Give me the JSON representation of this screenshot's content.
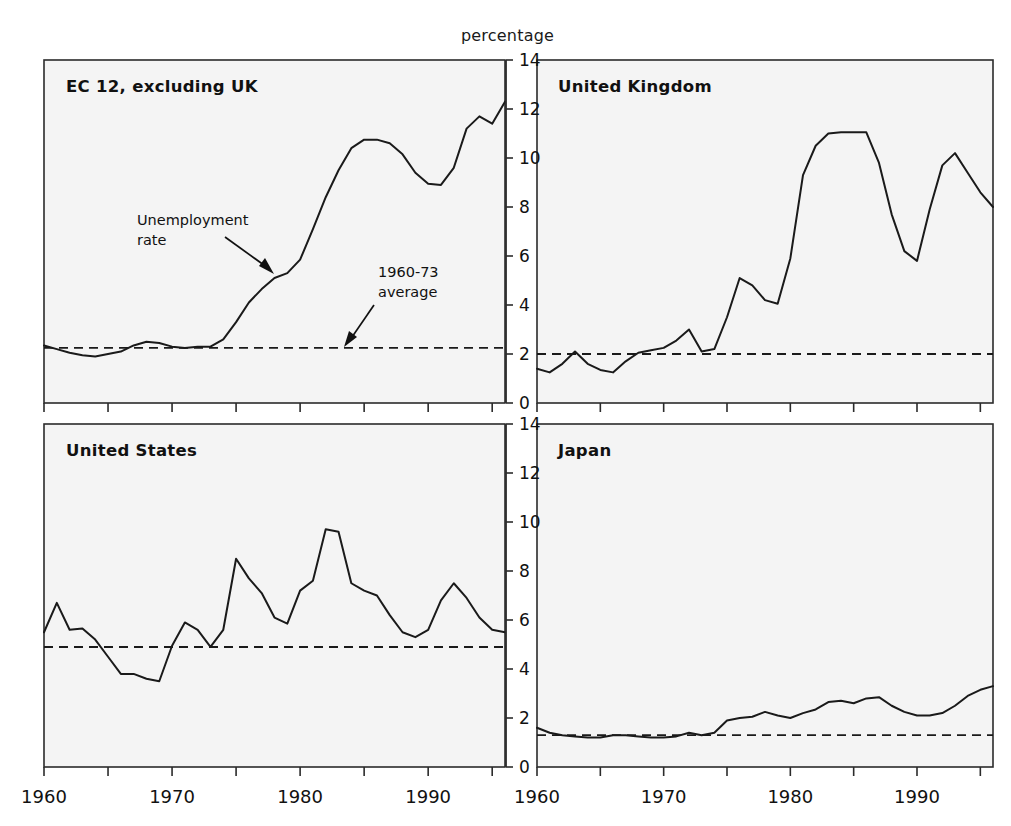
{
  "figure": {
    "unit_label": "percentage",
    "x_axis": {
      "min": 1960,
      "max": 1996,
      "major_ticks": [
        1960,
        1970,
        1980,
        1990
      ],
      "major_tick_labels": [
        "1960",
        "1970",
        "1980",
        "1990"
      ],
      "minor_tick_interval": 5
    },
    "y_axis": {
      "min": 0,
      "max": 14,
      "ticks": [
        0,
        2,
        4,
        6,
        8,
        10,
        12,
        14
      ],
      "tick_labels": [
        "0",
        "2",
        "4",
        "6",
        "8",
        "10",
        "12",
        "14"
      ],
      "position": "center-shared"
    },
    "annotations": [
      {
        "id": "unemployment-rate",
        "lines": [
          "Unemployment",
          "rate"
        ],
        "target_panel": "ec12",
        "target_x": 1978,
        "target_y": 5.6
      },
      {
        "id": "average-1960-73",
        "lines": [
          "1960-73",
          "average"
        ],
        "target_panel": "ec12",
        "target_x": 1984,
        "target_y": 2.3
      }
    ]
  },
  "chart_data": [
    {
      "type": "line",
      "panel": "ec12",
      "title": "EC 12, excluding UK",
      "xlabel": "",
      "ylabel": "percentage",
      "xlim": [
        1960,
        1996
      ],
      "ylim": [
        0,
        14
      ],
      "grid": false,
      "legend": "none",
      "series": [
        {
          "name": "Unemployment rate",
          "x": [
            1960,
            1961,
            1962,
            1963,
            1964,
            1965,
            1966,
            1967,
            1968,
            1969,
            1970,
            1971,
            1972,
            1973,
            1974,
            1975,
            1976,
            1977,
            1978,
            1979,
            1980,
            1981,
            1982,
            1983,
            1984,
            1985,
            1986,
            1987,
            1988,
            1989,
            1990,
            1991,
            1992,
            1993,
            1994,
            1995,
            1996
          ],
          "values": [
            2.35,
            2.2,
            2.05,
            1.95,
            1.9,
            2.0,
            2.1,
            2.35,
            2.5,
            2.45,
            2.3,
            2.25,
            2.3,
            2.3,
            2.6,
            3.3,
            4.1,
            4.65,
            5.1,
            5.3,
            5.85,
            7.1,
            8.4,
            9.5,
            10.4,
            10.75,
            10.75,
            10.6,
            10.15,
            9.4,
            8.95,
            8.9,
            9.6,
            11.2,
            11.7,
            11.4,
            12.3,
            12.5
          ]
        },
        {
          "name": "1960-73 average",
          "style": "dashed",
          "value": 2.25
        }
      ]
    },
    {
      "type": "line",
      "panel": "uk",
      "title": "United Kingdom",
      "xlabel": "",
      "ylabel": "percentage",
      "xlim": [
        1960,
        1996
      ],
      "ylim": [
        0,
        14
      ],
      "grid": false,
      "legend": "none",
      "series": [
        {
          "name": "Unemployment rate",
          "x": [
            1960,
            1961,
            1962,
            1963,
            1964,
            1965,
            1966,
            1967,
            1968,
            1969,
            1970,
            1971,
            1972,
            1973,
            1974,
            1975,
            1976,
            1977,
            1978,
            1979,
            1980,
            1981,
            1982,
            1983,
            1984,
            1985,
            1986,
            1987,
            1988,
            1989,
            1990,
            1991,
            1992,
            1993,
            1994,
            1995,
            1996
          ],
          "values": [
            1.4,
            1.25,
            1.6,
            2.1,
            1.6,
            1.35,
            1.25,
            1.7,
            2.05,
            2.15,
            2.25,
            2.55,
            3.0,
            2.1,
            2.2,
            3.5,
            5.1,
            4.8,
            4.2,
            4.05,
            5.9,
            9.3,
            10.5,
            11.0,
            11.05,
            11.05,
            11.05,
            9.8,
            7.7,
            6.2,
            5.8,
            7.9,
            9.7,
            10.2,
            9.4,
            8.6,
            8.0
          ]
        },
        {
          "name": "1960-73 average",
          "style": "dashed",
          "value": 2.0
        }
      ]
    },
    {
      "type": "line",
      "panel": "us",
      "title": "United States",
      "xlabel": "",
      "ylabel": "percentage",
      "xlim": [
        1960,
        1996
      ],
      "ylim": [
        0,
        14
      ],
      "grid": false,
      "legend": "none",
      "series": [
        {
          "name": "Unemployment rate",
          "x": [
            1960,
            1961,
            1962,
            1963,
            1964,
            1965,
            1966,
            1967,
            1968,
            1969,
            1970,
            1971,
            1972,
            1973,
            1974,
            1975,
            1976,
            1977,
            1978,
            1979,
            1980,
            1981,
            1982,
            1983,
            1984,
            1985,
            1986,
            1987,
            1988,
            1989,
            1990,
            1991,
            1992,
            1993,
            1994,
            1995,
            1996
          ],
          "values": [
            5.5,
            6.7,
            5.6,
            5.65,
            5.2,
            4.5,
            3.8,
            3.8,
            3.6,
            3.5,
            4.95,
            5.9,
            5.6,
            4.9,
            5.6,
            8.5,
            7.7,
            7.1,
            6.1,
            5.85,
            7.2,
            7.6,
            9.7,
            9.6,
            7.5,
            7.2,
            7.0,
            6.2,
            5.5,
            5.3,
            5.6,
            6.8,
            7.5,
            6.9,
            6.1,
            5.6,
            5.5
          ]
        },
        {
          "name": "1960-73 average",
          "style": "dashed",
          "value": 4.9
        }
      ]
    },
    {
      "type": "line",
      "panel": "japan",
      "title": "Japan",
      "xlabel": "",
      "ylabel": "percentage",
      "xlim": [
        1960,
        1996
      ],
      "ylim": [
        0,
        14
      ],
      "grid": false,
      "legend": "none",
      "series": [
        {
          "name": "Unemployment rate",
          "x": [
            1960,
            1961,
            1962,
            1963,
            1964,
            1965,
            1966,
            1967,
            1968,
            1969,
            1970,
            1971,
            1972,
            1973,
            1974,
            1975,
            1976,
            1977,
            1978,
            1979,
            1980,
            1981,
            1982,
            1983,
            1984,
            1985,
            1986,
            1987,
            1988,
            1989,
            1990,
            1991,
            1992,
            1993,
            1994,
            1995,
            1996
          ],
          "values": [
            1.6,
            1.4,
            1.3,
            1.25,
            1.2,
            1.2,
            1.3,
            1.3,
            1.25,
            1.2,
            1.2,
            1.25,
            1.4,
            1.3,
            1.4,
            1.9,
            2.0,
            2.05,
            2.25,
            2.1,
            2.0,
            2.2,
            2.35,
            2.65,
            2.7,
            2.6,
            2.8,
            2.85,
            2.5,
            2.25,
            2.1,
            2.1,
            2.2,
            2.5,
            2.9,
            3.15,
            3.3
          ]
        },
        {
          "name": "1960-73 average",
          "style": "dashed",
          "value": 1.3
        }
      ]
    }
  ]
}
